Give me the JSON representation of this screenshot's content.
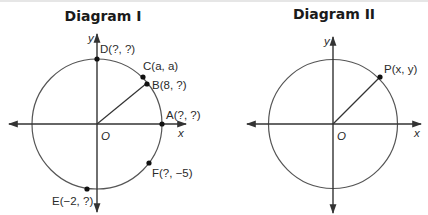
{
  "diagrams": [
    {
      "title": "Diagram I",
      "axis_labels": {
        "x": "x",
        "y": "y",
        "origin": "O"
      },
      "points": [
        {
          "id": "D",
          "label": "D(?, ?)",
          "coords": [
            "?",
            "?"
          ]
        },
        {
          "id": "C",
          "label": "C(a, a)",
          "coords": [
            "a",
            "a"
          ]
        },
        {
          "id": "B",
          "label": "B(8, ?)",
          "coords": [
            "8",
            "?"
          ]
        },
        {
          "id": "A",
          "label": "A(?, ?)",
          "coords": [
            "?",
            "?"
          ]
        },
        {
          "id": "F",
          "label": "F(?, −5)",
          "coords": [
            "?",
            "−5"
          ]
        },
        {
          "id": "E",
          "label": "E(−2, ?)",
          "coords": [
            "−2",
            "?"
          ]
        }
      ],
      "radius_drawn_to": "B"
    },
    {
      "title": "Diagram II",
      "axis_labels": {
        "x": "x",
        "y": "y",
        "origin": "O"
      },
      "points": [
        {
          "id": "P",
          "label": "P(x, y)",
          "coords": [
            "x",
            "y"
          ]
        }
      ],
      "radius_drawn_to": "P"
    }
  ],
  "colors": {
    "line": "#333333",
    "circle": "#555555",
    "text": "#2a2a2a",
    "background": "#ffffff"
  }
}
